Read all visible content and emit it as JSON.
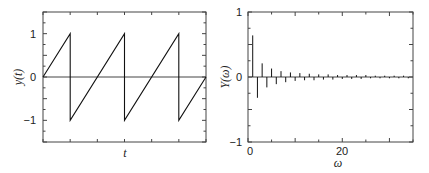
{
  "chart_data": [
    {
      "type": "line",
      "title": "",
      "xlabel": "t",
      "ylabel": "y(t)",
      "ylim": [
        -1.5,
        1.5
      ],
      "yticks": [
        -1,
        0,
        1
      ],
      "ytick_labels": [
        "−1",
        "0",
        "1"
      ],
      "xticks_labeled": false,
      "grid": false,
      "description": "Sawtooth wave, period 2, starting at 0 rising to 1, dropping to -1",
      "x": [
        0,
        1,
        1,
        3,
        3,
        5,
        5,
        6
      ],
      "values": [
        0,
        1,
        -1,
        1,
        -1,
        1,
        -1,
        0
      ],
      "xlim": [
        0,
        6
      ]
    },
    {
      "type": "bar",
      "style": "stem",
      "title": "",
      "xlabel": "ω",
      "ylabel": "Y(ω)",
      "xlim": [
        0,
        35
      ],
      "ylim": [
        -1,
        1
      ],
      "xticks": [
        0,
        20
      ],
      "yticks": [
        -1,
        0,
        1
      ],
      "ytick_labels": [
        "−1",
        "0",
        "1"
      ],
      "xtick_labels": [
        "0",
        "20"
      ],
      "grid": false,
      "x": [
        1,
        2,
        3,
        4,
        5,
        6,
        7,
        8,
        9,
        10,
        11,
        12,
        13,
        14,
        15,
        16,
        17,
        18,
        19,
        20,
        21,
        22,
        23,
        24,
        25,
        26,
        27,
        28,
        29,
        30,
        31,
        32,
        33,
        34
      ],
      "values": [
        0.64,
        -0.32,
        0.21,
        -0.16,
        0.13,
        -0.11,
        0.09,
        -0.08,
        0.07,
        -0.06,
        0.06,
        -0.05,
        0.05,
        -0.05,
        0.04,
        -0.04,
        0.04,
        -0.04,
        0.03,
        -0.03,
        0.03,
        -0.03,
        0.03,
        -0.03,
        0.03,
        -0.02,
        0.02,
        -0.02,
        0.02,
        -0.02,
        0.02,
        -0.02,
        0.02,
        -0.02
      ]
    }
  ],
  "left_plot": {
    "ylabel": "y(t)",
    "xlabel": "t",
    "ytick_labels": [
      "1",
      "0",
      "−1"
    ]
  },
  "right_plot": {
    "ylabel": "Y(ω)",
    "xlabel": "ω",
    "ytick_labels": [
      "1",
      "0",
      "−1"
    ],
    "xtick_labels": [
      "0",
      "20"
    ]
  }
}
